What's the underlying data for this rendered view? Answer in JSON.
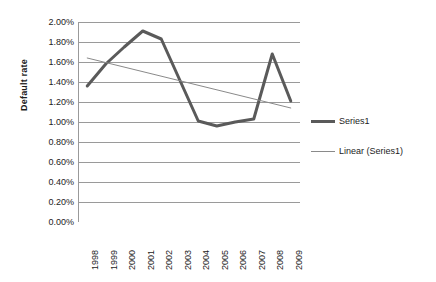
{
  "chart_data": {
    "type": "line",
    "title": "",
    "xlabel": "",
    "ylabel": "Default rate",
    "categories": [
      "1998",
      "1999",
      "2000",
      "2001",
      "2002",
      "2003",
      "2004",
      "2005",
      "2006",
      "2007",
      "2008",
      "2009"
    ],
    "ylim": [
      0.0,
      2.0
    ],
    "ytick_step": 0.2,
    "ytick_labels": [
      "0.00%",
      "0.20%",
      "0.40%",
      "0.60%",
      "0.80%",
      "1.00%",
      "1.20%",
      "1.40%",
      "1.60%",
      "1.80%",
      "2.00%"
    ],
    "ytick_values": [
      0.0,
      0.2,
      0.4,
      0.6,
      0.8,
      1.0,
      1.2,
      1.4,
      1.6,
      1.8,
      2.0
    ],
    "grid": true,
    "grid_axis": "y",
    "legend_position": "right",
    "series": [
      {
        "name": "Series1",
        "kind": "line",
        "color": "#5a5a5a",
        "width": 3,
        "values": [
          1.36,
          1.58,
          1.75,
          1.91,
          1.83,
          1.42,
          1.01,
          0.96,
          1.0,
          1.03,
          1.68,
          1.21
        ]
      },
      {
        "name": "Linear (Series1)",
        "kind": "trendline",
        "color": "#8a8a8a",
        "width": 1,
        "x_endpoints": [
          "1998",
          "2009"
        ],
        "y_endpoints": [
          1.64,
          1.14
        ]
      }
    ]
  },
  "legend": {
    "items": [
      {
        "label": "Series1",
        "swatch": "thick-line-swatch"
      },
      {
        "label": "Linear (Series1)",
        "swatch": "thin-line-swatch"
      }
    ]
  },
  "axes": {
    "y_title": "Default rate"
  }
}
